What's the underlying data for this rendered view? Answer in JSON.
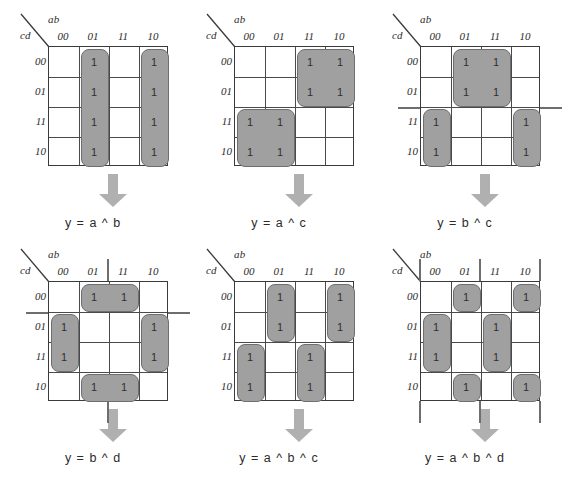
{
  "figure": {
    "title": "Karnaugh maps for XOR functions",
    "variable_label_top": "ab",
    "variable_label_side": "cd",
    "col_headers": [
      "00",
      "01",
      "11",
      "10"
    ],
    "row_headers": [
      "00",
      "01",
      "11",
      "10"
    ],
    "cell_one": "1",
    "colors": {
      "group_fill": "#a0a0a0",
      "group_border": "#6e6e6e",
      "grid_border": "#3a3a3a",
      "arrow_fill": "#b0b0b0",
      "text": "#2b2b2b",
      "background": "#ffffff"
    }
  },
  "maps": [
    {
      "id": "kmap-1",
      "formula": "y  =  a ^ b",
      "ones": [
        {
          "row": 0,
          "col": 1
        },
        {
          "row": 0,
          "col": 3
        },
        {
          "row": 1,
          "col": 1
        },
        {
          "row": 1,
          "col": 3
        },
        {
          "row": 2,
          "col": 1
        },
        {
          "row": 2,
          "col": 3
        },
        {
          "row": 3,
          "col": 1
        },
        {
          "row": 3,
          "col": 3
        }
      ],
      "groups": [
        {
          "row": 0,
          "col": 1,
          "rows": 4,
          "cols": 1
        },
        {
          "row": 0,
          "col": 3,
          "rows": 4,
          "cols": 1
        }
      ],
      "wraps": []
    },
    {
      "id": "kmap-2",
      "formula": "y  =  a ^ c",
      "ones": [
        {
          "row": 0,
          "col": 2
        },
        {
          "row": 0,
          "col": 3
        },
        {
          "row": 1,
          "col": 2
        },
        {
          "row": 1,
          "col": 3
        },
        {
          "row": 2,
          "col": 0
        },
        {
          "row": 2,
          "col": 1
        },
        {
          "row": 3,
          "col": 0
        },
        {
          "row": 3,
          "col": 1
        }
      ],
      "groups": [
        {
          "row": 0,
          "col": 2,
          "rows": 2,
          "cols": 2
        },
        {
          "row": 2,
          "col": 0,
          "rows": 2,
          "cols": 2
        }
      ],
      "wraps": []
    },
    {
      "id": "kmap-3",
      "formula": "y  =  b ^ c",
      "ones": [
        {
          "row": 0,
          "col": 1
        },
        {
          "row": 0,
          "col": 2
        },
        {
          "row": 1,
          "col": 1
        },
        {
          "row": 1,
          "col": 2
        },
        {
          "row": 2,
          "col": 0
        },
        {
          "row": 2,
          "col": 3
        },
        {
          "row": 3,
          "col": 0
        },
        {
          "row": 3,
          "col": 3
        }
      ],
      "groups": [
        {
          "row": 0,
          "col": 1,
          "rows": 2,
          "cols": 2
        },
        {
          "row": 2,
          "col": 0,
          "rows": 2,
          "cols": 1
        },
        {
          "row": 2,
          "col": 3,
          "rows": 2,
          "cols": 1
        }
      ],
      "wraps": [
        {
          "side": "left",
          "pos": 2,
          "span": 2
        },
        {
          "side": "right",
          "pos": 2,
          "span": 2
        }
      ]
    },
    {
      "id": "kmap-4",
      "formula": "y  =  b ^ d",
      "ones": [
        {
          "row": 0,
          "col": 1
        },
        {
          "row": 0,
          "col": 2
        },
        {
          "row": 1,
          "col": 0
        },
        {
          "row": 1,
          "col": 3
        },
        {
          "row": 2,
          "col": 0
        },
        {
          "row": 2,
          "col": 3
        },
        {
          "row": 3,
          "col": 1
        },
        {
          "row": 3,
          "col": 2
        }
      ],
      "groups": [
        {
          "row": 0,
          "col": 1,
          "rows": 1,
          "cols": 2
        },
        {
          "row": 3,
          "col": 1,
          "rows": 1,
          "cols": 2
        },
        {
          "row": 1,
          "col": 0,
          "rows": 2,
          "cols": 1
        },
        {
          "row": 1,
          "col": 3,
          "rows": 2,
          "cols": 1
        }
      ],
      "wraps": [
        {
          "side": "top",
          "pos": 1,
          "span": 2
        },
        {
          "side": "bottom",
          "pos": 1,
          "span": 2
        },
        {
          "side": "left",
          "pos": 1,
          "span": 2
        },
        {
          "side": "right",
          "pos": 1,
          "span": 2
        }
      ]
    },
    {
      "id": "kmap-5",
      "formula": "y  =  a ^ b ^ c",
      "ones": [
        {
          "row": 0,
          "col": 1
        },
        {
          "row": 0,
          "col": 3
        },
        {
          "row": 1,
          "col": 1
        },
        {
          "row": 1,
          "col": 3
        },
        {
          "row": 2,
          "col": 0
        },
        {
          "row": 2,
          "col": 2
        },
        {
          "row": 3,
          "col": 0
        },
        {
          "row": 3,
          "col": 2
        }
      ],
      "groups": [
        {
          "row": 0,
          "col": 1,
          "rows": 2,
          "cols": 1
        },
        {
          "row": 0,
          "col": 3,
          "rows": 2,
          "cols": 1
        },
        {
          "row": 2,
          "col": 0,
          "rows": 2,
          "cols": 1
        },
        {
          "row": 2,
          "col": 2,
          "rows": 2,
          "cols": 1
        }
      ],
      "wraps": []
    },
    {
      "id": "kmap-6",
      "formula": "y  =  a ^ b ^ d",
      "ones": [
        {
          "row": 0,
          "col": 1
        },
        {
          "row": 0,
          "col": 3
        },
        {
          "row": 1,
          "col": 0
        },
        {
          "row": 1,
          "col": 2
        },
        {
          "row": 2,
          "col": 0
        },
        {
          "row": 2,
          "col": 2
        },
        {
          "row": 3,
          "col": 1
        },
        {
          "row": 3,
          "col": 3
        }
      ],
      "groups": [
        {
          "row": 0,
          "col": 1,
          "rows": 1,
          "cols": 1
        },
        {
          "row": 0,
          "col": 3,
          "rows": 1,
          "cols": 1
        },
        {
          "row": 1,
          "col": 0,
          "rows": 2,
          "cols": 1
        },
        {
          "row": 1,
          "col": 2,
          "rows": 2,
          "cols": 1
        },
        {
          "row": 3,
          "col": 1,
          "rows": 1,
          "cols": 1
        },
        {
          "row": 3,
          "col": 3,
          "rows": 1,
          "cols": 1
        }
      ],
      "wraps": [
        {
          "side": "top",
          "pos": 1,
          "span": 1
        },
        {
          "side": "top",
          "pos": 3,
          "span": 1
        },
        {
          "side": "bottom",
          "pos": 1,
          "span": 1
        },
        {
          "side": "bottom",
          "pos": 3,
          "span": 1
        },
        {
          "side": "top",
          "pos": 0,
          "span": 1,
          "edge": true
        },
        {
          "side": "top",
          "pos": 2,
          "span": 1,
          "edge": true
        },
        {
          "side": "bottom",
          "pos": 0,
          "span": 1,
          "edge": true
        },
        {
          "side": "bottom",
          "pos": 2,
          "span": 1,
          "edge": true
        }
      ]
    }
  ]
}
